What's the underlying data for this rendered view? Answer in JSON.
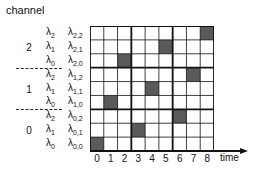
{
  "title": "channel",
  "axis": {
    "x_label": "time",
    "x_ticks": [
      "0",
      "1",
      "2",
      "3",
      "4",
      "5",
      "6",
      "7",
      "8"
    ]
  },
  "channels": [
    {
      "label": "2",
      "rows": [
        {
          "lambda": "2",
          "full": "2,2",
          "shaded_col": 8
        },
        {
          "lambda": "1",
          "full": "2,1",
          "shaded_col": 5
        },
        {
          "lambda": "0",
          "full": "2,0",
          "shaded_col": 2
        }
      ]
    },
    {
      "label": "1",
      "rows": [
        {
          "lambda": "2",
          "full": "1,2",
          "shaded_col": 7
        },
        {
          "lambda": "1",
          "full": "1,1",
          "shaded_col": 4
        },
        {
          "lambda": "0",
          "full": "1,0",
          "shaded_col": 1
        }
      ]
    },
    {
      "label": "0",
      "rows": [
        {
          "lambda": "2",
          "full": "0,2",
          "shaded_col": 6
        },
        {
          "lambda": "1",
          "full": "0,1",
          "shaded_col": 3
        },
        {
          "lambda": "0",
          "full": "0,0",
          "shaded_col": 0
        }
      ]
    }
  ],
  "colors": {
    "shaded": "#5a5a5a",
    "grid": "#111111",
    "background": "#ffffff"
  }
}
